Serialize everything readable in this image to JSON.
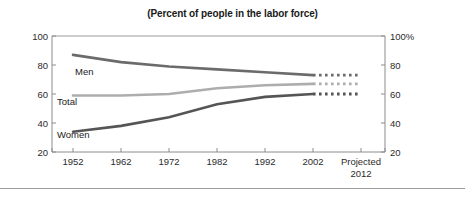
{
  "chart_data": {
    "type": "line",
    "title": "(Percent of people in the labor force)",
    "xlabel": "",
    "ylabel": "",
    "ylim": [
      20,
      100
    ],
    "yticks": [
      20,
      40,
      60,
      80,
      100
    ],
    "y_tick_labels_left": [
      "100",
      "80",
      "60",
      "40",
      "20"
    ],
    "y_tick_labels_right": [
      "100%",
      "80",
      "60",
      "40",
      "20"
    ],
    "grid": false,
    "legend": "inline-labels",
    "x": [
      1952,
      1962,
      1972,
      1982,
      1992,
      2002,
      2012
    ],
    "x_tick_labels": [
      "1952",
      "1962",
      "1972",
      "1982",
      "1992",
      "2002",
      "Projected"
    ],
    "projected_sublabel": "2012",
    "projection_starts_at": 2002,
    "series": [
      {
        "name": "Men",
        "color": "#6b6b6b",
        "values": [
          87,
          82,
          79,
          77,
          75,
          73,
          73
        ],
        "projected_values": [
          73,
          73
        ]
      },
      {
        "name": "Total",
        "color": "#adadad",
        "values": [
          59,
          59,
          60,
          64,
          66,
          67,
          67
        ],
        "projected_values": [
          67,
          67
        ]
      },
      {
        "name": "Women",
        "color": "#555555",
        "values": [
          34,
          38,
          44,
          53,
          58,
          60,
          60
        ],
        "projected_values": [
          60,
          60
        ]
      }
    ]
  },
  "axis": {
    "left_labels": [
      "100",
      "80",
      "60",
      "40",
      "20"
    ],
    "right_labels": [
      "100%",
      "80",
      "60",
      "40",
      "20"
    ],
    "x_labels": [
      "1952",
      "1962",
      "1972",
      "1982",
      "1992",
      "2002",
      "Projected"
    ],
    "projected_year": "2012"
  },
  "series_labels": {
    "men": "Men",
    "total": "Total",
    "women": "Women"
  },
  "colors": {
    "men": "#6b6b6b",
    "total": "#adadad",
    "women": "#555555",
    "axis": "#8c8c8c",
    "text": "#1a1a1a",
    "rule": "#9a9a9a"
  }
}
